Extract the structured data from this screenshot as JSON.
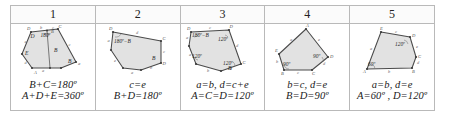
{
  "table": {
    "headers": [
      "1",
      "2",
      "3",
      "4",
      "5"
    ],
    "columns": [
      {
        "id": "case-1",
        "number": "1",
        "figure": {
          "shape": "pentagon-with-internal-segment",
          "vertex_labels": [
            "D",
            "C",
            "B",
            "A",
            "E"
          ],
          "edge_labels": [
            "b",
            "c",
            "a",
            "e",
            "d"
          ],
          "angle_labels": [
            "180°"
          ],
          "region_labels": [
            "D",
            "B",
            "E"
          ]
        },
        "caption_line1": "B+C=180º",
        "caption_line2": "A+D+E=360º"
      },
      {
        "id": "case-2",
        "number": "2",
        "figure": {
          "shape": "pentagon",
          "vertex_labels": [
            "D",
            "C",
            "D"
          ],
          "edge_labels": [
            "d",
            "c",
            "e",
            "b",
            "a"
          ],
          "angle_labels": [
            "180º−B"
          ],
          "region_labels": [
            "B"
          ]
        },
        "caption_line1": "c=e",
        "caption_line2": "B+D=180º"
      },
      {
        "id": "case-3",
        "number": "3",
        "figure": {
          "shape": "pentagon",
          "vertex_labels": [
            "D",
            "C",
            "B"
          ],
          "edge_labels": [
            "c",
            "d",
            "e",
            "a",
            "b"
          ],
          "angle_labels": [
            "180º−B",
            "120º",
            "120º",
            "120º"
          ],
          "region_labels": []
        },
        "caption_line1": "a=b,  d=c+e",
        "caption_line2": "A=C=D=120º"
      },
      {
        "id": "case-4",
        "number": "4",
        "figure": {
          "shape": "pentagon",
          "vertex_labels": [
            "A",
            "D",
            "C",
            "B",
            "E"
          ],
          "edge_labels": [
            "a",
            "e",
            "c",
            "d",
            "b"
          ],
          "angle_labels": [
            "90º",
            "90º"
          ],
          "region_labels": []
        },
        "caption_line1": "b=c,  d=e",
        "caption_line2": "B=D=90º"
      },
      {
        "id": "case-5",
        "number": "5",
        "figure": {
          "shape": "pentagon",
          "vertex_labels": [
            "E",
            "D",
            "C",
            "B",
            "A"
          ],
          "edge_labels": [
            "c",
            "e",
            "d",
            "b",
            "a"
          ],
          "angle_labels": [
            "120º",
            "60º"
          ],
          "region_labels": []
        },
        "caption_line1": "a=b,  d=e",
        "caption_line2": "A=60º ,  D=120º"
      }
    ]
  },
  "style": {
    "polygon_fill": "#e2e2e2",
    "polygon_stroke": "#4a4a4a",
    "grid_line": "#b9b9b9",
    "text_color": "#1a1a1a",
    "page_background": "#ffffff"
  }
}
